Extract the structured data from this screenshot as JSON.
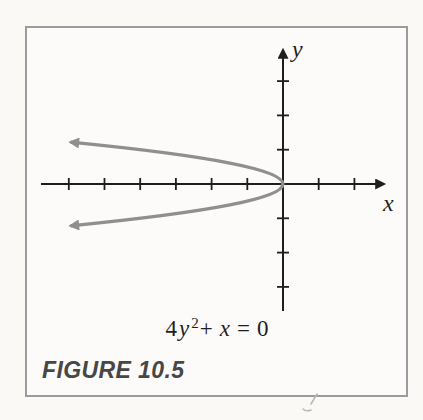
{
  "figure": {
    "caption": "FIGURE 10.5"
  },
  "axes": {
    "x_label": "x",
    "y_label": "y"
  },
  "equation": {
    "coefficient": "4",
    "variable_y": "y",
    "exponent": "2",
    "plus": "+",
    "variable_x": "x",
    "equals": "=",
    "zero": "0"
  },
  "colors": {
    "axis": "#1e1e1e",
    "curve": "#8f8f8f",
    "border": "#9b9b9b",
    "caption": "#474747",
    "background": "#faf9f6"
  },
  "chart_data": {
    "type": "line",
    "equation": "x = -4y²",
    "xlabel": "x",
    "ylabel": "y",
    "grid": false,
    "axis_numbers_labeled": false,
    "x_ticks": [
      -6,
      -5,
      -4,
      -3,
      -2,
      -1,
      1,
      2
    ],
    "y_ticks": [
      -3,
      -2,
      -1,
      1,
      2,
      3
    ],
    "xlim": [
      -6.8,
      2.9
    ],
    "ylim": [
      -3.8,
      4.1
    ],
    "curve": {
      "a": -4,
      "y_min": -1.22,
      "y_max": 1.22,
      "vertex": {
        "x": 0,
        "y": 0
      },
      "opens": "left",
      "arrow_ends": true,
      "points": [
        {
          "y": -1.22,
          "x": -5.95
        },
        {
          "y": -1.0,
          "x": -4.0
        },
        {
          "y": -0.75,
          "x": -2.25
        },
        {
          "y": -0.5,
          "x": -1.0
        },
        {
          "y": -0.25,
          "x": -0.25
        },
        {
          "y": 0.0,
          "x": 0.0
        },
        {
          "y": 0.25,
          "x": -0.25
        },
        {
          "y": 0.5,
          "x": -1.0
        },
        {
          "y": 0.75,
          "x": -2.25
        },
        {
          "y": 1.0,
          "x": -4.0
        },
        {
          "y": 1.22,
          "x": -5.95
        }
      ]
    }
  }
}
